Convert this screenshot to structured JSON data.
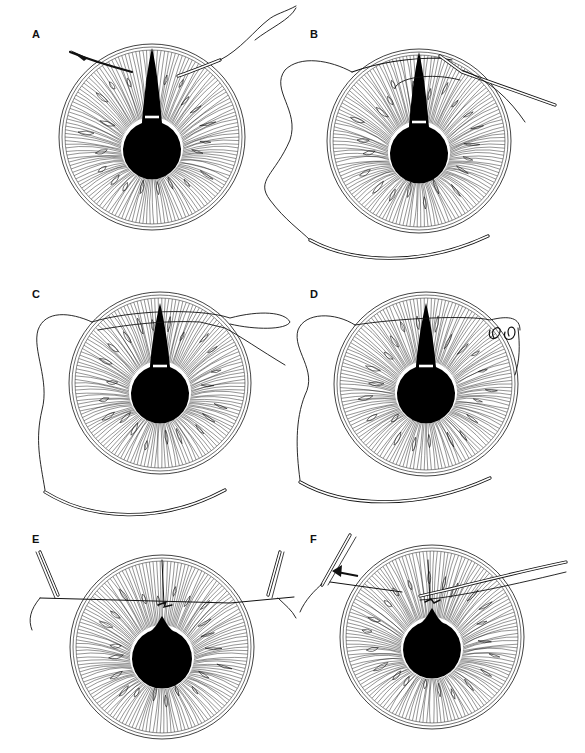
{
  "figure": {
    "ink_color": "#111111",
    "paper_color": "#ffffff",
    "panels": [
      {
        "id": "A",
        "label": "A",
        "label_pos": [
          32,
          38
        ],
        "iris": {
          "cx": 152,
          "cy": 137,
          "r": 93
        },
        "pupil": {
          "cx": 152,
          "cy": 148,
          "r": 29,
          "apex_y": 48
        },
        "slit_bar_y": 117,
        "description": "Needle passed through iris edges on each side of iris defect"
      },
      {
        "id": "B",
        "label": "B",
        "label_pos": [
          310,
          38
        ],
        "iris": {
          "cx": 419,
          "cy": 141,
          "r": 92
        },
        "pupil": {
          "cx": 419,
          "cy": 152,
          "r": 29,
          "apex_y": 52
        },
        "slit_bar_y": 122,
        "description": "Suture retrieved with hook through paracentesis"
      },
      {
        "id": "C",
        "label": "C",
        "label_pos": [
          32,
          298
        ],
        "iris": {
          "cx": 160,
          "cy": 383,
          "r": 91
        },
        "pupil": {
          "cx": 160,
          "cy": 392,
          "r": 29,
          "apex_y": 303
        },
        "slit_bar_y": 366,
        "description": "Suture loop externalized"
      },
      {
        "id": "D",
        "label": "D",
        "label_pos": [
          310,
          298
        ],
        "iris": {
          "cx": 426,
          "cy": 384,
          "r": 92
        },
        "pupil": {
          "cx": 426,
          "cy": 392,
          "r": 29,
          "apex_y": 303
        },
        "slit_bar_y": 366,
        "description": "Knot tied with loops outside the eye"
      },
      {
        "id": "E",
        "label": "E",
        "label_pos": [
          32,
          543
        ],
        "iris": {
          "cx": 162,
          "cy": 647,
          "r": 92
        },
        "pupil": {
          "cx": 162,
          "cy": 657,
          "r": 30,
          "apex_y": 616
        },
        "description": "Knot slid into anterior chamber with forceps"
      },
      {
        "id": "F",
        "label": "F",
        "label_pos": [
          310,
          543
        ],
        "iris": {
          "cx": 432,
          "cy": 637,
          "r": 92
        },
        "pupil": {
          "cx": 432,
          "cy": 648,
          "r": 29,
          "apex_y": 608
        },
        "description": "Suture cut with scissors; arrow shows withdrawal"
      }
    ]
  }
}
